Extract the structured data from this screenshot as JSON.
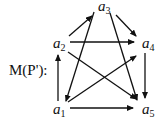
{
  "diagram": {
    "title": "M(P'):",
    "nodes": [
      {
        "id": "a1",
        "letter": "a",
        "sub": "1",
        "x": 60,
        "y": 110
      },
      {
        "id": "a2",
        "letter": "a",
        "sub": "2",
        "x": 60,
        "y": 44
      },
      {
        "id": "a3",
        "letter": "a",
        "sub": "3",
        "x": 104,
        "y": 7
      },
      {
        "id": "a4",
        "letter": "a",
        "sub": "4",
        "x": 148,
        "y": 44
      },
      {
        "id": "a5",
        "letter": "a",
        "sub": "5",
        "x": 148,
        "y": 110
      }
    ],
    "edges": [
      {
        "from": "a2",
        "to": "a3"
      },
      {
        "from": "a3",
        "to": "a4"
      },
      {
        "from": "a2",
        "to": "a4"
      },
      {
        "from": "a3",
        "to": "a1"
      },
      {
        "from": "a3",
        "to": "a5"
      },
      {
        "from": "a2",
        "to": "a5"
      },
      {
        "from": "a1",
        "to": "a4"
      },
      {
        "from": "a1",
        "to": "a2"
      },
      {
        "from": "a4",
        "to": "a5"
      },
      {
        "from": "a1",
        "to": "a5"
      }
    ],
    "color": "#111111"
  }
}
